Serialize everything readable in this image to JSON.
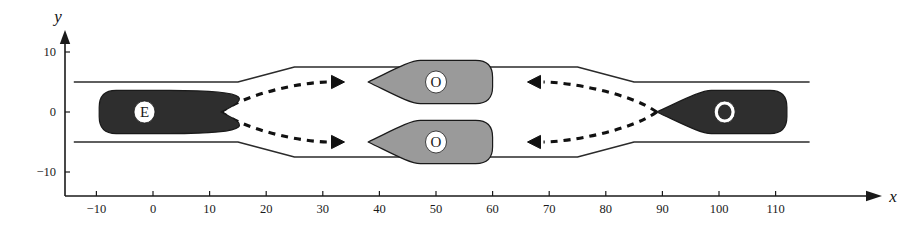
{
  "figure": {
    "type": "diagram",
    "title": "",
    "background_color": "#ffffff",
    "line_color": "#1a1a1a"
  },
  "axes": {
    "x_axis": {
      "label": "x",
      "ticks": [
        -10,
        0,
        10,
        20,
        30,
        40,
        50,
        60,
        70,
        80,
        90,
        100,
        110
      ],
      "tick_labels": [
        "−10",
        "0",
        "10",
        "20",
        "30",
        "40",
        "50",
        "60",
        "70",
        "80",
        "90",
        "100",
        "110"
      ],
      "range": [
        -15,
        117
      ],
      "arrow": true
    },
    "y_axis": {
      "label": "y",
      "ticks": [
        10,
        0,
        -10
      ],
      "tick_labels": [
        "10",
        "0",
        "−10"
      ],
      "range": [
        -16,
        13
      ],
      "arrow": true
    }
  },
  "road": {
    "description": "two-lane corridor with a widened middle section",
    "narrow_half_width": 5,
    "wide_half_width": 7.5,
    "left_flare_start_x": 15,
    "left_flare_end_x": 25,
    "right_flare_start_x": 75,
    "right_flare_end_x": 85,
    "x_start": -14,
    "x_end": 116,
    "edge_color": "#2b2b2b"
  },
  "vehicles": [
    {
      "id": "ego",
      "label": "E",
      "fill": "#2e2e2e",
      "label_circle_fill": "#ffffff",
      "label_color": "#1a1a1a",
      "heading": "right",
      "center_x": -1.5,
      "center_y": 0,
      "nose_x": 12,
      "tail_x": -9.5
    },
    {
      "id": "other-upper",
      "label": "O",
      "fill": "#9a9a9a",
      "label_circle_fill": "#ffffff",
      "label_color": "#1a1a1a",
      "heading": "left",
      "center_x": 50,
      "center_y": 5,
      "nose_x": 38,
      "tail_x": 60
    },
    {
      "id": "other-lower",
      "label": "O",
      "fill": "#9a9a9a",
      "label_circle_fill": "#ffffff",
      "label_color": "#1a1a1a",
      "heading": "left",
      "center_x": 50,
      "center_y": -5,
      "nose_x": 38,
      "tail_x": 60
    },
    {
      "id": "other-right",
      "label": "O",
      "fill": "#2e2e2e",
      "label_circle_fill": "#ffffff",
      "label_color": "#2e2e2e",
      "heading": "left",
      "center_x": 101,
      "center_y": 0,
      "nose_x": 89,
      "tail_x": 112
    }
  ],
  "trajectories": [
    {
      "id": "ego-upper-branch",
      "style": "dashed",
      "direction": "right",
      "from": {
        "x": 12,
        "y": 0
      },
      "to": {
        "x": 31,
        "y": 5
      },
      "arrowhead": "right"
    },
    {
      "id": "ego-lower-branch",
      "style": "dashed",
      "direction": "right",
      "from": {
        "x": 12,
        "y": 0
      },
      "to": {
        "x": 31,
        "y": -5
      },
      "arrowhead": "right"
    },
    {
      "id": "other-upper-branch",
      "style": "dashed",
      "direction": "left",
      "from": {
        "x": 89,
        "y": 0
      },
      "to": {
        "x": 69,
        "y": 5
      },
      "arrowhead": "left"
    },
    {
      "id": "other-lower-branch",
      "style": "dashed",
      "direction": "left",
      "from": {
        "x": 89,
        "y": 0
      },
      "to": {
        "x": 69,
        "y": -5
      },
      "arrowhead": "left"
    }
  ]
}
